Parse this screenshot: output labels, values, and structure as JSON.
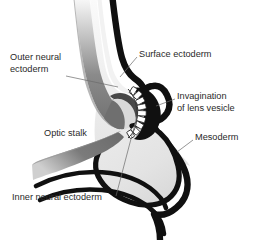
{
  "figure": {
    "background_color": "#ffffff",
    "width": 254,
    "height": 240
  },
  "palette": {
    "outline_black": "#101010",
    "neural_ectoderm_gray": "#6f6f6f",
    "neural_ectoderm_dark": "#565656",
    "mesoderm_fill": "#e4e4e4",
    "interior_light": "#ededed",
    "lens_cell_white": "#ffffff",
    "label_color": "#2a2a2a",
    "leader_line_color": "#6a6a6a"
  },
  "labels": [
    {
      "id": "outer-neural-ectoderm",
      "lines": [
        "Outer neural",
        "ectoderm"
      ],
      "x": 10,
      "y": 58,
      "anchor": "start"
    },
    {
      "id": "surface-ectoderm",
      "lines": [
        "Surface ectoderm"
      ],
      "x": 139,
      "y": 55,
      "anchor": "start"
    },
    {
      "id": "invagination-of-lens-vesicle",
      "lines": [
        "Invagination",
        "of lens vesicle"
      ],
      "x": 177,
      "y": 97,
      "anchor": "start"
    },
    {
      "id": "optic-stalk",
      "lines": [
        "Optic stalk"
      ],
      "x": 44,
      "y": 134,
      "anchor": "start"
    },
    {
      "id": "mesoderm",
      "lines": [
        "Mesoderm"
      ],
      "x": 195,
      "y": 138,
      "anchor": "start"
    },
    {
      "id": "inner-neural-ectoderm",
      "lines": [
        "Inner neural ectoderm"
      ],
      "x": 12,
      "y": 198,
      "anchor": "start"
    }
  ],
  "leaders": [
    {
      "id": "leader-outer-neural-ectoderm",
      "path": "M 66 76 L 118 87"
    },
    {
      "id": "leader-surface-ectoderm",
      "path": "M 137 57 L 120 77"
    },
    {
      "id": "leader-invagination",
      "path": "M 175 99 L 156 106"
    },
    {
      "id": "leader-mesoderm",
      "path": "M 193 140 L 177 152"
    },
    {
      "id": "leader-inner-neural-ectoderm",
      "path": "M 116 196 L 137 116"
    }
  ],
  "structures": [
    {
      "id": "surface-ectoderm-band",
      "name": "Surface ectoderm",
      "color": "#101010"
    },
    {
      "id": "outer-neural-ectoderm-band",
      "name": "Outer neural ectoderm",
      "color": "#6f6f6f"
    },
    {
      "id": "inner-neural-ectoderm-layer",
      "name": "Inner neural ectoderm",
      "color": "#101010"
    },
    {
      "id": "optic-stalk-band",
      "name": "Optic stalk",
      "color": "#6f6f6f"
    },
    {
      "id": "mesoderm-mass",
      "name": "Mesoderm",
      "color": "#e4e4e4"
    },
    {
      "id": "lens-vesicle-cells",
      "name": "Invaginating lens vesicle cells",
      "color": "#ffffff"
    }
  ]
}
